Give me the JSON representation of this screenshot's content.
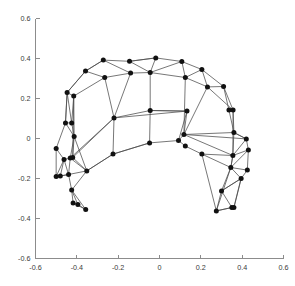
{
  "chart_data": {
    "type": "scatter",
    "title": "",
    "subtitle": "",
    "xlabel": "",
    "ylabel": "",
    "xlim": [
      -0.6,
      0.6
    ],
    "ylim": [
      -0.6,
      0.6
    ],
    "grid": false,
    "legend": null,
    "x_ticks": [
      -0.6,
      -0.4,
      -0.2,
      0,
      0.2,
      0.4,
      0.6
    ],
    "y_ticks": [
      -0.6,
      -0.4,
      -0.2,
      0,
      0.2,
      0.4,
      0.6
    ],
    "x_tick_labels": [
      "-0.6",
      "-0.4",
      "-0.2",
      "0",
      "0.2",
      "0.4",
      "0.6"
    ],
    "y_tick_labels": [
      "-0.6",
      "-0.4",
      "-0.2",
      "0",
      "0.2",
      "0.4",
      "0.6"
    ],
    "marker": "filled-circle",
    "marker_color": "#111111",
    "edge_color": "#4a4a4a",
    "axis_color": "#8c8c8c",
    "nodes": [
      [
        -0.5,
        -0.05
      ],
      [
        -0.455,
        0.078
      ],
      [
        -0.425,
        0.078
      ],
      [
        -0.413,
        0.01
      ],
      [
        -0.447,
        0.23
      ],
      [
        -0.415,
        0.212
      ],
      [
        -0.358,
        0.337
      ],
      [
        -0.265,
        0.305
      ],
      [
        -0.272,
        0.392
      ],
      [
        -0.145,
        0.386
      ],
      [
        -0.14,
        0.327
      ],
      [
        -0.018,
        0.403
      ],
      [
        -0.045,
        0.33
      ],
      [
        0.108,
        0.385
      ],
      [
        0.125,
        0.305
      ],
      [
        0.205,
        0.345
      ],
      [
        0.232,
        0.258
      ],
      [
        0.31,
        0.26
      ],
      [
        0.336,
        0.142
      ],
      [
        0.356,
        0.142
      ],
      [
        0.36,
        0.03
      ],
      [
        0.42,
        -0.002
      ],
      [
        0.43,
        -0.057
      ],
      [
        0.355,
        -0.085
      ],
      [
        0.345,
        -0.145
      ],
      [
        0.425,
        -0.158
      ],
      [
        0.395,
        -0.2
      ],
      [
        0.3,
        -0.262
      ],
      [
        0.35,
        -0.345
      ],
      [
        0.36,
        -0.345
      ],
      [
        0.275,
        -0.362
      ],
      [
        0.205,
        -0.078
      ],
      [
        0.125,
        -0.038
      ],
      [
        0.133,
        0.137
      ],
      [
        0.118,
        0.02
      ],
      [
        -0.045,
        0.14
      ],
      [
        -0.22,
        0.103
      ],
      [
        -0.225,
        -0.078
      ],
      [
        -0.048,
        -0.022
      ],
      [
        0.092,
        -0.01
      ],
      [
        -0.352,
        -0.162
      ],
      [
        -0.42,
        -0.095
      ],
      [
        -0.432,
        -0.098
      ],
      [
        -0.5,
        -0.19
      ],
      [
        -0.462,
        -0.105
      ],
      [
        -0.44,
        -0.18
      ],
      [
        -0.425,
        -0.258
      ],
      [
        -0.418,
        -0.322
      ],
      [
        -0.395,
        -0.33
      ],
      [
        -0.357,
        -0.355
      ],
      [
        -0.48,
        -0.188
      ]
    ],
    "node_count": 51,
    "background": "#ffffff"
  }
}
